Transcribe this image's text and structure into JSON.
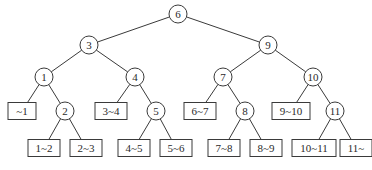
{
  "diagram": {
    "type": "binary-search-tree",
    "stroke_color": "#3a3a3a",
    "internal_nodes": [
      {
        "id": "n6",
        "label": "6",
        "x": 178,
        "y": 14
      },
      {
        "id": "n3",
        "label": "3",
        "x": 89,
        "y": 45
      },
      {
        "id": "n9",
        "label": "9",
        "x": 268,
        "y": 45
      },
      {
        "id": "n1",
        "label": "1",
        "x": 44,
        "y": 77
      },
      {
        "id": "n4",
        "label": "4",
        "x": 135,
        "y": 77
      },
      {
        "id": "n7",
        "label": "7",
        "x": 223,
        "y": 77
      },
      {
        "id": "n10",
        "label": "10",
        "x": 313,
        "y": 77
      },
      {
        "id": "n2",
        "label": "2",
        "x": 65,
        "y": 111
      },
      {
        "id": "n5",
        "label": "5",
        "x": 156,
        "y": 111
      },
      {
        "id": "n8",
        "label": "8",
        "x": 245,
        "y": 111
      },
      {
        "id": "n11",
        "label": "11",
        "x": 335,
        "y": 111
      }
    ],
    "leaves": [
      {
        "id": "l_1",
        "label": "~1",
        "x": 22,
        "y": 111
      },
      {
        "id": "l_3_4",
        "label": "3~4",
        "x": 111,
        "y": 111
      },
      {
        "id": "l_6_7",
        "label": "6~7",
        "x": 200,
        "y": 111
      },
      {
        "id": "l_9_10",
        "label": "9~10",
        "x": 291,
        "y": 111
      },
      {
        "id": "l_1_2",
        "label": "1~2",
        "x": 44,
        "y": 148
      },
      {
        "id": "l_2_3",
        "label": "2~3",
        "x": 86,
        "y": 148
      },
      {
        "id": "l_4_5",
        "label": "4~5",
        "x": 134,
        "y": 148
      },
      {
        "id": "l_5_6",
        "label": "5~6",
        "x": 176,
        "y": 148
      },
      {
        "id": "l_7_8",
        "label": "7~8",
        "x": 224,
        "y": 148
      },
      {
        "id": "l_8_9",
        "label": "8~9",
        "x": 266,
        "y": 148
      },
      {
        "id": "l_10_11",
        "label": "10~11",
        "x": 314,
        "y": 148
      },
      {
        "id": "l_11",
        "label": "11~",
        "x": 356,
        "y": 148
      }
    ],
    "edges": [
      [
        "n6",
        "n3"
      ],
      [
        "n6",
        "n9"
      ],
      [
        "n3",
        "n1"
      ],
      [
        "n3",
        "n4"
      ],
      [
        "n9",
        "n7"
      ],
      [
        "n9",
        "n10"
      ],
      [
        "n1",
        "l_1"
      ],
      [
        "n1",
        "n2"
      ],
      [
        "n4",
        "l_3_4"
      ],
      [
        "n4",
        "n5"
      ],
      [
        "n7",
        "l_6_7"
      ],
      [
        "n7",
        "n8"
      ],
      [
        "n10",
        "l_9_10"
      ],
      [
        "n10",
        "n11"
      ],
      [
        "n2",
        "l_1_2"
      ],
      [
        "n2",
        "l_2_3"
      ],
      [
        "n5",
        "l_4_5"
      ],
      [
        "n5",
        "l_5_6"
      ],
      [
        "n8",
        "l_7_8"
      ],
      [
        "n8",
        "l_8_9"
      ],
      [
        "n11",
        "l_10_11"
      ],
      [
        "n11",
        "l_11"
      ]
    ]
  }
}
